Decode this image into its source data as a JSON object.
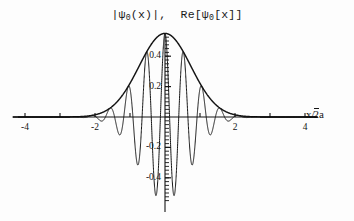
{
  "figure": {
    "title_parts": {
      "abs_open": "|ψ",
      "abs_sub": "0",
      "abs_close": "(x)|,",
      "re_open": "Re[ψ",
      "re_sub": "0",
      "re_close": "[x]]"
    },
    "title_plain": "|ψ₀(x)|, Re[ψ₀[x]]",
    "axis_x_label_num": "x",
    "axis_x_label_slash": "/",
    "axis_x_label_radicand": "2",
    "axis_x_label_tail": "a",
    "axis_x_label_plain": "x/√2a",
    "line_color": "#141414",
    "bg_color": "#fdfdfd"
  },
  "chart_data": {
    "type": "line",
    "xlabel": "x/√2a",
    "ylabel": "",
    "xlim": [
      -4.6,
      4.6
    ],
    "ylim": [
      -0.58,
      0.58
    ],
    "grid": false,
    "legend": "none",
    "xticks": [
      -4,
      -3,
      -2,
      -1,
      1,
      2,
      3,
      4
    ],
    "xtick_labels": [
      "-4",
      "",
      "-2",
      "",
      "",
      "2",
      "",
      "4"
    ],
    "xtick_labels_shown": [
      "-4",
      "-2",
      "2",
      "4"
    ],
    "yticks": [
      -0.4,
      -0.2,
      0.2,
      0.4
    ],
    "ytick_labels": [
      "-0.4",
      "-0.2",
      "0.2",
      "0.4"
    ],
    "y_minor_tick_step": 0.025,
    "series": [
      {
        "name": "|ψ₀(x)|",
        "role": "envelope",
        "formula": "0.55*exp(-x^2/1.1)",
        "amplitude": 0.55,
        "x": [
          -4.6,
          -4.2,
          -3.8,
          -3.4,
          -3.0,
          -2.8,
          -2.6,
          -2.4,
          -2.2,
          -2.0,
          -1.8,
          -1.6,
          -1.4,
          -1.2,
          -1.0,
          -0.8,
          -0.6,
          -0.4,
          -0.2,
          0.0,
          0.2,
          0.4,
          0.6,
          0.8,
          1.0,
          1.2,
          1.4,
          1.6,
          1.8,
          2.0,
          2.2,
          2.4,
          2.6,
          2.8,
          3.0,
          3.4,
          3.8,
          4.2,
          4.6
        ],
        "values": [
          0.0,
          0.0001,
          0.0003,
          0.0011,
          0.0037,
          0.007,
          0.0128,
          0.0225,
          0.0381,
          0.062,
          0.0972,
          0.1464,
          0.212,
          0.2951,
          0.3948,
          0.5079,
          0.6281,
          0.747,
          0.8552,
          0.9435,
          0.8552,
          0.747,
          0.6281,
          0.5079,
          0.3948,
          0.2951,
          0.212,
          0.1464,
          0.0972,
          0.062,
          0.0381,
          0.0225,
          0.0128,
          0.007,
          0.0037,
          0.0011,
          0.0003,
          0.0001,
          0.0
        ]
      },
      {
        "name": "Re[ψ₀[x]]",
        "role": "oscillation",
        "formula": "0.55*exp(-x^2/1.1)*cos(12*x)",
        "wavenumber": 12.0,
        "amplitude": 0.55,
        "peak_value": 0.55,
        "trough_value": -0.55,
        "oscillation_extent": [
          -2.2,
          2.2
        ]
      }
    ]
  }
}
